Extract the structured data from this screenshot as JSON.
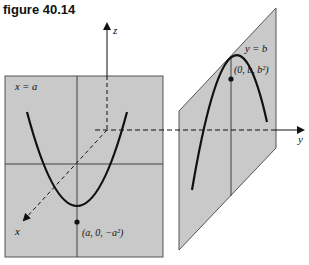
{
  "figure": {
    "title": "figure 40.14",
    "axes": {
      "z_label": "z",
      "y_label": "y",
      "x_label": "x"
    },
    "left_plane": {
      "label": "x = a",
      "point_label": "(a, 0, −a²)"
    },
    "right_plane": {
      "label": "y = b",
      "point_label": "(0, b, b²)"
    },
    "colors": {
      "plane_fill": "#c9c9c9",
      "line": "#111111"
    }
  }
}
